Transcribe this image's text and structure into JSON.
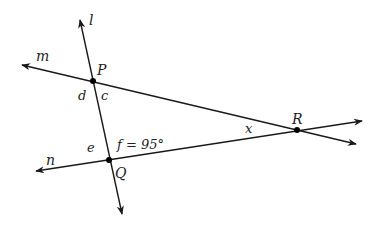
{
  "diagram": {
    "type": "geometry-lines-transversal",
    "lines": [
      {
        "name": "l",
        "label": "l"
      },
      {
        "name": "m",
        "label": "m"
      },
      {
        "name": "n",
        "label": "n"
      }
    ],
    "points": [
      {
        "name": "P",
        "label": "P"
      },
      {
        "name": "Q",
        "label": "Q"
      },
      {
        "name": "R",
        "label": "R"
      }
    ],
    "angles": {
      "c": "c",
      "d": "d",
      "e": "e",
      "f": "f = 95°",
      "x": "x"
    },
    "colors": {
      "stroke": "#1a1a1a",
      "text": "#222222",
      "background": "#ffffff"
    }
  }
}
